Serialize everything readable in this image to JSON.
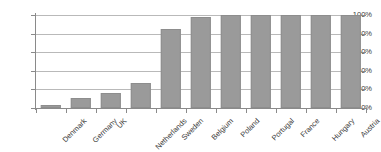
{
  "chart_data": {
    "type": "bar",
    "title": "",
    "xlabel": "",
    "ylabel": "",
    "categories": [
      "Denmark",
      "Germany",
      "UK",
      "Netherlands",
      "Sweden",
      "Belgium",
      "Poland",
      "Portugal",
      "France",
      "Hungary",
      "Austria"
    ],
    "values": [
      3,
      11,
      16,
      27,
      85,
      98,
      100,
      100,
      100,
      100,
      100
    ],
    "ylim": [
      0,
      100
    ],
    "ytick_labels": [
      "0%",
      "20%",
      "40%",
      "60%",
      "80%",
      "100%"
    ],
    "ytick_values": [
      0,
      20,
      40,
      60,
      80,
      100
    ],
    "grid": true,
    "legend": "none",
    "bar_color": "#9a9a9a",
    "bar_border_color": "#8d8d8d",
    "gridline_color": "#b9b9b9",
    "axis_color": "#8a8a8a",
    "text_color": "#3a3a3a",
    "background": "#ffffff"
  }
}
